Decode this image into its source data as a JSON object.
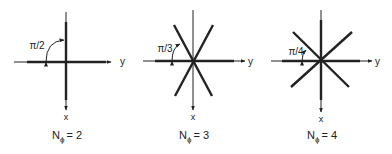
{
  "figures": [
    {
      "n_phi_label": "N",
      "n_phi_sub": "ϕ",
      "n_phi_value": "= 2",
      "angle_label": "π/2",
      "x_axis_label": "x",
      "y_axis_label": "y"
    },
    {
      "n_phi_label": "N",
      "n_phi_sub": "ϕ",
      "n_phi_value": "= 3",
      "angle_label": "π/3",
      "x_axis_label": "x",
      "y_axis_label": "y"
    },
    {
      "n_phi_label": "N",
      "n_phi_sub": "ϕ",
      "n_phi_value": "= 4",
      "angle_label": "π/4",
      "x_axis_label": "x",
      "y_axis_label": "y"
    }
  ],
  "colors": {
    "line": "#222222",
    "background": "#ffffff"
  }
}
